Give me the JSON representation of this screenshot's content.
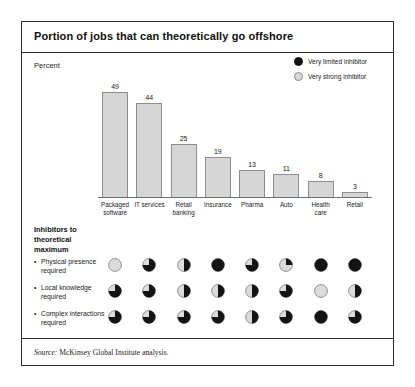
{
  "exhibit": {
    "title": "Portion of jobs that can theoretically go offshore",
    "unit_label": "Percent",
    "source_prefix": "Source:",
    "source_text": "McKinsey Global Institute analysis."
  },
  "legend": {
    "items": [
      {
        "label": "Very limited inhibitor",
        "swatch": "filled-circle-icon",
        "color": "#141414"
      },
      {
        "label": "Very strong inhibitor",
        "swatch": "empty-circle-icon",
        "color": "#d8d8d8"
      }
    ]
  },
  "chart_data": {
    "type": "bar",
    "title": "Portion of jobs that can theoretically go offshore",
    "xlabel": "",
    "ylabel": "Percent",
    "ylim": [
      0,
      52
    ],
    "grid": false,
    "categories": [
      "Packaged software",
      "IT services",
      "Retail banking",
      "Insurance",
      "Pharma",
      "Auto",
      "Health care",
      "Retail"
    ],
    "category_lines": [
      [
        "Packaged",
        "software"
      ],
      [
        "IT services",
        ""
      ],
      [
        "Retail",
        "banking"
      ],
      [
        "Insurance",
        ""
      ],
      [
        "Pharma",
        ""
      ],
      [
        "Auto",
        ""
      ],
      [
        "Health",
        "care"
      ],
      [
        "Retail",
        ""
      ]
    ],
    "values": [
      49,
      44,
      25,
      19,
      13,
      11,
      8,
      3
    ],
    "bar_fill": "#d6d6d6",
    "bar_stroke": "#8d8d8d"
  },
  "inhibitors": {
    "heading_lines": [
      "Inhibitors to",
      "theoretical",
      "maximum"
    ],
    "bullet_glyph": "•",
    "rows": [
      {
        "label_lines": [
          "Physical presence",
          "required"
        ],
        "values": [
          0,
          0.75,
          0.5,
          1,
          0.75,
          0.25,
          1,
          1
        ]
      },
      {
        "label_lines": [
          "Local knowledge",
          "required"
        ],
        "values": [
          0.75,
          0.75,
          0.5,
          0.5,
          0.5,
          0.75,
          0,
          0.5
        ]
      },
      {
        "label_lines": [
          "Complex interactions",
          "required"
        ],
        "values": [
          0.75,
          0.75,
          0.75,
          0.75,
          0.5,
          0.75,
          1,
          0.75
        ]
      }
    ]
  }
}
